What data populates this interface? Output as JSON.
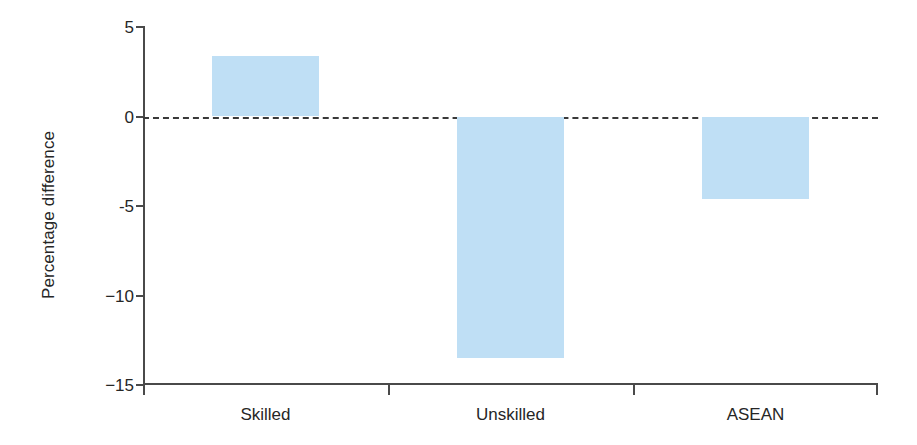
{
  "chart_data": {
    "type": "bar",
    "title": "",
    "subtitle": "",
    "xlabel": "",
    "ylabel": "Percentage difference",
    "categories": [
      "Skilled",
      "Unskilled",
      "ASEAN"
    ],
    "values": [
      3.4,
      -13.5,
      -4.6
    ],
    "ylim": [
      -15,
      5
    ],
    "yticks": [
      5,
      0,
      -5,
      -10,
      -15
    ],
    "ytick_labels": [
      "5",
      "0",
      "-5",
      "−10",
      "−15"
    ],
    "grid": false,
    "legend": "none",
    "zero_reference_line": {
      "value": 0,
      "style": "dashed",
      "color": "#3a3a3a"
    },
    "bar_color": "#bfdff5",
    "axis_color": "#4a4a4a",
    "background_color": "#ffffff",
    "series": [
      {
        "name": "Percentage difference",
        "values": [
          3.4,
          -13.5,
          -4.6
        ]
      }
    ]
  },
  "axis": {
    "y_title": "Percentage difference",
    "ticks": [
      {
        "label": "5",
        "value": 5
      },
      {
        "label": "0",
        "value": 0
      },
      {
        "label": "-5",
        "value": -5
      },
      {
        "label": "−10",
        "value": -10
      },
      {
        "label": "−15",
        "value": -15
      }
    ]
  },
  "bars": [
    {
      "label": "Skilled",
      "value": 3.4
    },
    {
      "label": "Unskilled",
      "value": -13.5
    },
    {
      "label": "ASEAN",
      "value": -4.6
    }
  ]
}
